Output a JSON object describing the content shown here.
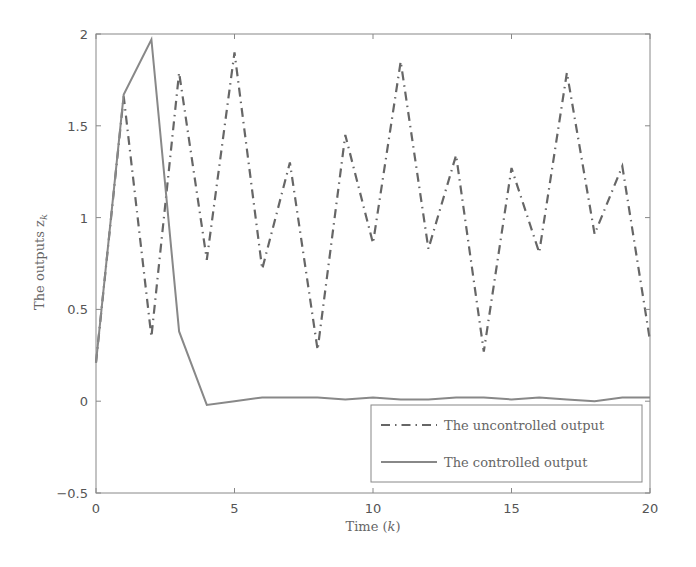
{
  "chart_data": {
    "type": "line",
    "title": "",
    "xlabel": "Time (k)",
    "ylabel": "The outputs z_k",
    "xlim": [
      0,
      20
    ],
    "ylim": [
      -0.5,
      2
    ],
    "x_ticks": [
      0,
      5,
      10,
      15,
      20
    ],
    "y_ticks": [
      -0.5,
      0,
      0.5,
      1,
      1.5,
      2
    ],
    "x_tick_labels": [
      "0",
      "5",
      "10",
      "15",
      "20"
    ],
    "y_tick_labels": [
      "−0.5",
      "0",
      "0.5",
      "1",
      "1.5",
      "2"
    ],
    "grid": false,
    "legend_position": "lower right",
    "x": [
      0,
      1,
      2,
      3,
      4,
      5,
      6,
      7,
      8,
      9,
      10,
      11,
      12,
      13,
      14,
      15,
      16,
      17,
      18,
      19,
      20
    ],
    "series": [
      {
        "name": "The uncontrolled output",
        "style": "dash-dot",
        "color": "#666666",
        "values": [
          0.21,
          1.66,
          0.35,
          1.79,
          0.77,
          1.9,
          0.72,
          1.3,
          0.28,
          1.45,
          0.86,
          1.85,
          0.83,
          1.34,
          0.27,
          1.27,
          0.81,
          1.79,
          0.91,
          1.28,
          0.33
        ]
      },
      {
        "name": "The controlled output",
        "style": "solid",
        "color": "#888888",
        "values": [
          0.21,
          1.67,
          1.97,
          0.38,
          -0.02,
          0.0,
          0.02,
          0.02,
          0.02,
          0.01,
          0.02,
          0.01,
          0.01,
          0.02,
          0.02,
          0.01,
          0.02,
          0.01,
          0.0,
          0.02,
          0.02
        ]
      }
    ]
  },
  "labels": {
    "xlabel_text": "Time (",
    "xlabel_var": "k",
    "xlabel_close": ")",
    "ylabel_text": "The outputs z",
    "ylabel_sub": "k"
  }
}
